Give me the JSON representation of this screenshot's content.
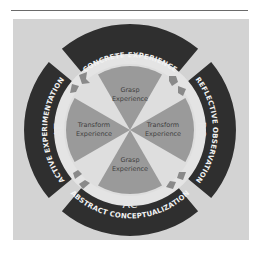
{
  "figure": {
    "colors": {
      "panel": "#d3d3d3",
      "band": "#2f2f2f",
      "ring": "#e4e4e4",
      "sector": "#9a9a9a",
      "arrow": "#8a8a8a",
      "band_text": "#f2f2f2",
      "sector_text": "#3f3f3f"
    }
  },
  "stages": [
    {
      "id": "ce",
      "title": "CONCRETE EXPERIENCE",
      "abbr": "CE",
      "position": "top"
    },
    {
      "id": "ro",
      "title": "REFLECTIVE OBSERVATION",
      "abbr": "RO",
      "position": "right"
    },
    {
      "id": "ac",
      "title": "ABSTRACT CONCEPTUALIZATION",
      "abbr": "AC",
      "position": "bottom"
    },
    {
      "id": "ae",
      "title": "ACTIVE EXPERIMENTATION",
      "abbr": "AE",
      "position": "left"
    }
  ],
  "sectors": [
    {
      "position": "top",
      "line1": "Grasp",
      "line2": "Experience"
    },
    {
      "position": "right",
      "line1": "Transform",
      "line2": "Experience"
    },
    {
      "position": "bottom",
      "line1": "Grasp",
      "line2": "Experience"
    },
    {
      "position": "left",
      "line1": "Transform",
      "line2": "Experience"
    }
  ]
}
